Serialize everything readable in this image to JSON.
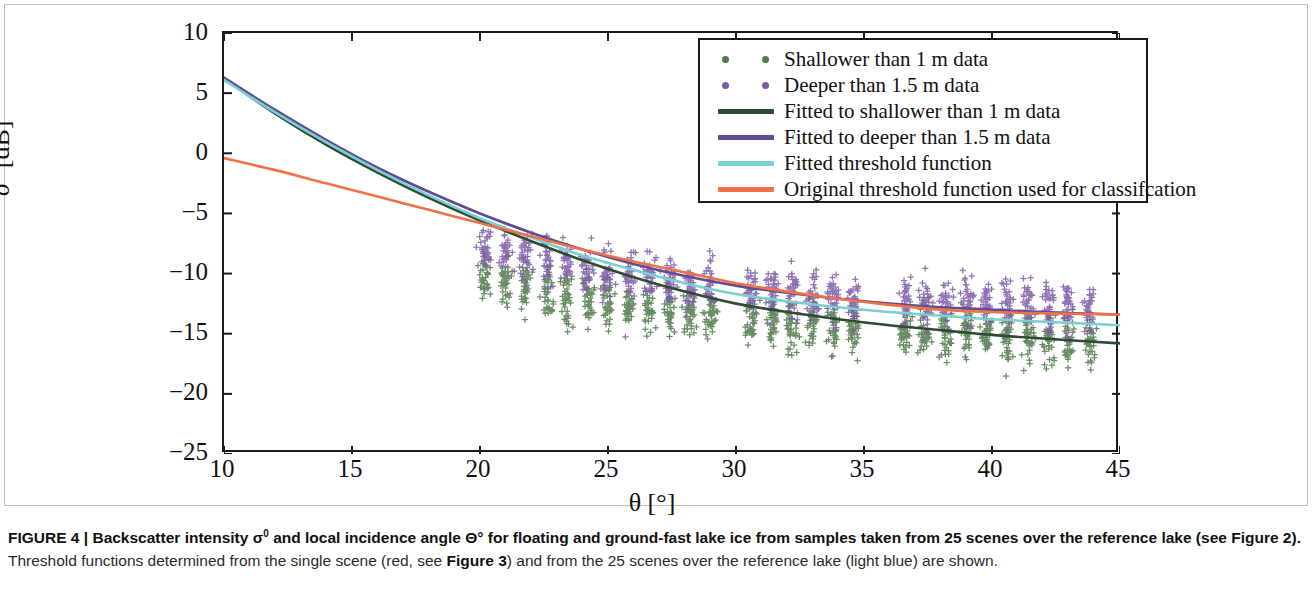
{
  "figure": {
    "caption_lead": "FIGURE 4 | Backscatter intensity σ",
    "caption_lead_sup": "0",
    "caption_lead_2": " and local incidence angle Θ° for floating and ground-fast lake ice from samples taken from 25 scenes over the reference lake (see Figure 2).",
    "caption_rest_1": " Threshold functions determined from the single scene (red, see ",
    "caption_bold_fig3": "Figure 3",
    "caption_rest_2": ") and from the 25 scenes over the reference lake (light blue) are shown."
  },
  "axes": {
    "xlabel": "θ [°]",
    "ylabel_sigma": "σ",
    "ylabel_sup": "0",
    "ylabel_unit": " [dB]",
    "xticks": [
      "10",
      "15",
      "20",
      "25",
      "30",
      "35",
      "40",
      "45"
    ],
    "yticks": [
      "10",
      "5",
      "0",
      "−5",
      "−10",
      "−15",
      "−20",
      "−25"
    ]
  },
  "legend": {
    "items": [
      {
        "label": "Shallower than 1 m data",
        "kind": "dots",
        "color": "#4e7a4a"
      },
      {
        "label": "Deeper than 1.5 m data",
        "kind": "dots",
        "color": "#7d5aa8"
      },
      {
        "label": "Fitted to shallower than 1 m data",
        "kind": "line",
        "color": "#2f4a33"
      },
      {
        "label": "Fitted to deeper than 1.5 m data",
        "kind": "line",
        "color": "#5e4b94"
      },
      {
        "label": "Fitted threshold function",
        "kind": "line",
        "color": "#79cfd3"
      },
      {
        "label": "Original threshold function used for classifcation",
        "kind": "line",
        "color": "#ef7145"
      }
    ]
  },
  "chart_data": {
    "type": "scatter",
    "title": "",
    "xlabel": "θ [°]",
    "ylabel": "σ⁰ [dB]",
    "xlim": [
      10,
      45
    ],
    "ylim": [
      -25,
      10
    ],
    "xticks": [
      10,
      15,
      20,
      25,
      30,
      35,
      40,
      45
    ],
    "yticks": [
      10,
      5,
      0,
      -5,
      -10,
      -15,
      -20,
      -25
    ],
    "grid": false,
    "legend_position": "top-right",
    "marker": "plus",
    "scatter_series": [
      {
        "name": "Shallower than 1 m data",
        "color": "#4e7a4a",
        "cluster_centers_x": [
          20.2,
          21.0,
          21.8,
          22.6,
          23.4,
          24.2,
          25.0,
          25.8,
          26.6,
          27.4,
          28.2,
          29.0,
          30.6,
          31.4,
          32.2,
          33.0,
          33.8,
          34.6,
          36.6,
          37.4,
          38.2,
          39.0,
          39.8,
          40.6,
          41.4,
          42.2,
          43.0,
          43.8
        ],
        "cluster_mean_y": [
          -10.2,
          -10.6,
          -11.0,
          -11.4,
          -11.8,
          -12.1,
          -12.4,
          -12.7,
          -12.9,
          -13.2,
          -13.4,
          -13.6,
          -14.0,
          -14.1,
          -14.3,
          -14.4,
          -14.5,
          -14.6,
          -14.9,
          -15.0,
          -15.0,
          -15.1,
          -15.2,
          -15.2,
          -15.3,
          -15.3,
          -15.4,
          -15.4
        ],
        "spread_y": 2.4,
        "n_points_per_cluster": 38
      },
      {
        "name": "Deeper than 1.5 m data",
        "color": "#7d5aa8",
        "cluster_centers_x": [
          20.2,
          21.0,
          21.8,
          22.6,
          23.4,
          24.2,
          25.0,
          25.8,
          26.6,
          27.4,
          28.2,
          29.0,
          30.6,
          31.4,
          32.2,
          33.0,
          33.8,
          34.6,
          36.6,
          37.4,
          38.2,
          39.0,
          39.8,
          40.6,
          41.4,
          42.2,
          43.0,
          43.8
        ],
        "cluster_mean_y": [
          -7.6,
          -8.1,
          -8.5,
          -8.9,
          -9.3,
          -9.6,
          -9.9,
          -10.2,
          -10.4,
          -10.7,
          -10.9,
          -11.1,
          -11.4,
          -11.5,
          -11.6,
          -11.8,
          -11.9,
          -12.0,
          -12.2,
          -12.3,
          -12.3,
          -12.4,
          -12.5,
          -12.5,
          -12.6,
          -12.6,
          -12.7,
          -12.7
        ],
        "spread_y": 2.2,
        "n_points_per_cluster": 34
      }
    ],
    "curves": [
      {
        "name": "Fitted to shallower than 1 m data",
        "color": "#2f4a33",
        "width": 2.6,
        "x": [
          10,
          12,
          14,
          16,
          18,
          20,
          22,
          24,
          26,
          28,
          30,
          32,
          34,
          36,
          38,
          40,
          42,
          45
        ],
        "y": [
          6.2,
          3.3,
          0.7,
          -1.6,
          -3.7,
          -5.6,
          -7.3,
          -8.9,
          -10.3,
          -11.5,
          -12.5,
          -13.2,
          -13.8,
          -14.3,
          -14.7,
          -15.1,
          -15.4,
          -15.8
        ]
      },
      {
        "name": "Fitted to deeper than 1.5 m data",
        "color": "#5e4b94",
        "width": 2.6,
        "x": [
          10,
          12,
          14,
          16,
          18,
          20,
          22,
          24,
          26,
          28,
          30,
          32,
          34,
          36,
          38,
          40,
          42,
          45
        ],
        "y": [
          6.3,
          3.6,
          1.1,
          -1.2,
          -3.2,
          -5.0,
          -6.6,
          -8.0,
          -9.2,
          -10.2,
          -11.0,
          -11.6,
          -12.1,
          -12.5,
          -12.8,
          -13.0,
          -13.2,
          -13.4
        ]
      },
      {
        "name": "Fitted threshold function",
        "color": "#79cfd3",
        "width": 2.6,
        "x": [
          10,
          12,
          14,
          16,
          18,
          20,
          22,
          24,
          26,
          28,
          30,
          32,
          34,
          36,
          38,
          40,
          42,
          45
        ],
        "y": [
          6.1,
          3.4,
          0.9,
          -1.4,
          -3.5,
          -5.4,
          -7.0,
          -8.5,
          -9.7,
          -10.8,
          -11.7,
          -12.3,
          -12.8,
          -13.2,
          -13.5,
          -13.8,
          -14.0,
          -14.3
        ]
      },
      {
        "name": "Original threshold function used for classifcation",
        "color": "#ef7145",
        "width": 2.6,
        "x": [
          10,
          12,
          14,
          16,
          18,
          20,
          22,
          24,
          26,
          28,
          30,
          32,
          34,
          36,
          38,
          40,
          42,
          45
        ],
        "y": [
          -0.4,
          -1.4,
          -2.5,
          -3.6,
          -4.7,
          -5.8,
          -6.9,
          -8.0,
          -9.0,
          -9.9,
          -10.8,
          -11.5,
          -12.1,
          -12.6,
          -13.0,
          -13.2,
          -13.3,
          -13.4
        ]
      }
    ]
  }
}
